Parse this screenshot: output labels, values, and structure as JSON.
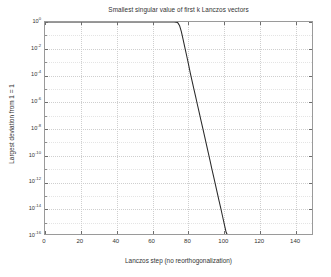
{
  "chart_data": {
    "type": "line",
    "title": "Smallest singular value of first k Lanczos vectors",
    "xlabel": "Lanczos step (no reorthogonalization)",
    "ylabel": "Largest deviation from 1 = 1",
    "yscale": "log",
    "xscale": "linear",
    "xlim": [
      0,
      150
    ],
    "ylim": [
      1e-16,
      1
    ],
    "grid": true,
    "legend": null,
    "xticks": [
      0,
      20,
      40,
      60,
      80,
      100,
      120,
      140
    ],
    "xticklabels": [
      "0",
      "20",
      "40",
      "60",
      "80",
      "100",
      "120",
      "140"
    ],
    "yticks": [
      1,
      0.01,
      0.0001,
      1e-06,
      1e-08,
      1e-10,
      1e-12,
      1e-14,
      1e-16
    ],
    "yticklabels": [
      {
        "base": "10",
        "exp": "0"
      },
      {
        "base": "10",
        "exp": "-2"
      },
      {
        "base": "10",
        "exp": "-4"
      },
      {
        "base": "10",
        "exp": "-6"
      },
      {
        "base": "10",
        "exp": "-8"
      },
      {
        "base": "10",
        "exp": "-10"
      },
      {
        "base": "10",
        "exp": "-12"
      },
      {
        "base": "10",
        "exp": "-14"
      },
      {
        "base": "10",
        "exp": "-16"
      }
    ],
    "series": [
      {
        "name": "smallest singular value deviation",
        "color": "#2a2a2a",
        "x": [
          1,
          2,
          3,
          4,
          5,
          6,
          7,
          8,
          9,
          10,
          11,
          12,
          13,
          14,
          15,
          16,
          17,
          18,
          19,
          20,
          21,
          22,
          23,
          24,
          25,
          26,
          27,
          28,
          29,
          30,
          31,
          32,
          33,
          34,
          35,
          36,
          37,
          38,
          39,
          40,
          41,
          42,
          43,
          44,
          45,
          46,
          47,
          48,
          49,
          50,
          51,
          52,
          53,
          54,
          55,
          56,
          57,
          58,
          59,
          60,
          61,
          62,
          63,
          64,
          65,
          66,
          67,
          68,
          69,
          70,
          71,
          72,
          73,
          74,
          75,
          76,
          77,
          78,
          79,
          80,
          81,
          82,
          83,
          84,
          85,
          86,
          87,
          88,
          89,
          90,
          91,
          92,
          93,
          94,
          95,
          96,
          97,
          98,
          99,
          100,
          101,
          102,
          103,
          104,
          105,
          106,
          107,
          108,
          109,
          110,
          111,
          112,
          113,
          114,
          115,
          116,
          117,
          118,
          119,
          120,
          121,
          122,
          123,
          124,
          125,
          126,
          127,
          128,
          129,
          130,
          131,
          132,
          133,
          134,
          135,
          136,
          137,
          138,
          139,
          140,
          141,
          142,
          143,
          144,
          145,
          146,
          147,
          148,
          149,
          150
        ],
        "y": [
          1.0,
          1.0,
          1.0,
          1.0,
          1.0,
          1.0,
          1.0,
          1.0,
          1.0,
          1.0,
          1.0,
          1.0,
          1.0,
          1.0,
          1.0,
          1.0,
          1.0,
          1.0,
          1.0,
          1.0,
          1.0,
          1.0,
          1.0,
          1.0,
          1.0,
          1.0,
          1.0,
          1.0,
          1.0,
          1.0,
          1.0,
          1.0,
          1.0,
          1.0,
          1.0,
          1.0,
          1.0,
          1.0,
          1.0,
          1.0,
          1.0,
          1.0,
          1.0,
          1.0,
          1.0,
          1.0,
          1.0,
          1.0,
          1.0,
          1.0,
          1.0,
          1.0,
          1.0,
          1.0,
          1.0,
          1.0,
          1.0,
          1.0,
          1.0,
          1.0,
          1.0,
          1.0,
          1.0,
          1.0,
          1.0,
          1.0,
          1.0,
          1.0,
          0.999,
          0.998,
          0.995,
          0.99,
          0.97,
          0.9,
          0.55,
          0.2,
          0.05,
          0.012,
          0.003,
          0.0007,
          0.00016,
          4e-05,
          1e-05,
          2.6e-06,
          6.5e-07,
          1.7e-07,
          4.2e-08,
          1.1e-08,
          2.8e-09,
          7e-10,
          1.8e-10,
          4.5e-11,
          1.1e-11,
          2.9e-12,
          7.2e-13,
          1.8e-13,
          4.6e-14,
          1.2e-14,
          3e-15,
          7.5e-16,
          1.9e-16,
          4.8e-17,
          1.2e-17,
          3e-18,
          7.6e-19,
          1.9e-19,
          4.8e-20,
          1.2e-20,
          3e-21,
          7.6e-22,
          1.9e-22,
          4.8e-23,
          1.2e-23,
          4e-24,
          8e-25,
          6e-25,
          5e-25,
          5.2e-25,
          5e-25,
          4.8e-25,
          5e-25,
          3e-25,
          2e-25,
          2.1e-25,
          2e-25,
          2e-25,
          2.1e-25,
          2e-25,
          2e-25,
          2.1e-25,
          2e-25,
          2e-25,
          2.2e-25,
          2e-25,
          2e-25,
          2.1e-25,
          2e-25,
          2e-25,
          2e-25,
          2.1e-25,
          2e-25,
          2.2e-25,
          2e-25,
          2e-25,
          2.1e-25,
          2e-25,
          2e-25,
          2.1e-25,
          2e-25,
          2e-25
        ]
      }
    ]
  },
  "colors": {
    "curve": "#2a2a2a",
    "axis": "#9a9a9a",
    "grid": "#cfcfcf",
    "text": "#333333",
    "background": "#ffffff"
  }
}
